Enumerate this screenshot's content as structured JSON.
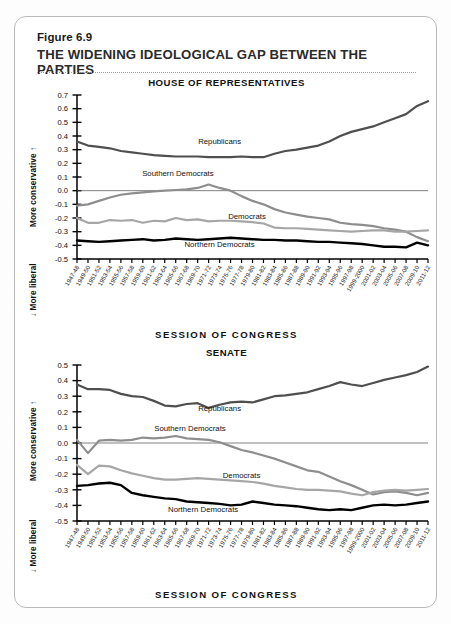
{
  "figure": {
    "number_label": "Figure 6.9",
    "title": "THE WIDENING IDEOLOGICAL GAP BETWEEN THE PARTIES"
  },
  "axis_titles": {
    "y_top": "More conservative",
    "y_bottom": "More liberal",
    "y_top_arrow": "↑",
    "y_bottom_arrow": "↓",
    "x": "SESSION OF CONGRESS"
  },
  "colors": {
    "republicans": "#4f4f4f",
    "southern_democrats": "#8e8e8e",
    "democrats": "#a6a6a6",
    "northern_democrats": "#000000",
    "axis": "#000000",
    "card_border": "#b9b9b9",
    "background": "#ffffff"
  },
  "chart_data": [
    {
      "type": "line",
      "title": "HOUSE OF REPRESENTATIVES",
      "xlabel": "SESSION OF CONGRESS",
      "ylabel": "More conservative / More liberal",
      "ylim": [
        -0.5,
        0.7
      ],
      "yticks": [
        0.7,
        0.6,
        0.5,
        0.4,
        0.3,
        0.2,
        0.1,
        0.0,
        -0.1,
        -0.2,
        -0.3,
        -0.4,
        -0.5
      ],
      "ytick_labels": [
        "0.7",
        "0.6",
        "0.5",
        "0.4",
        "0.3",
        "0.2",
        "0.1",
        "0.0",
        "-0.1",
        "-0.2",
        "-0.3",
        "-0.4",
        "-0.5"
      ],
      "grid": false,
      "zero_line": true,
      "legend_position": "inline-annotations",
      "categories": [
        "1947-48",
        "1949-50",
        "1951-52",
        "1953-54",
        "1955-56",
        "1957-58",
        "1959-60",
        "1961-62",
        "1963-64",
        "1965-66",
        "1967-68",
        "1969-70",
        "1971-72",
        "1973-74",
        "1975-76",
        "1977-78",
        "1979-80",
        "1981-82",
        "1983-84",
        "1985-86",
        "1987-88",
        "1989-90",
        "1991-92",
        "1993-94",
        "1995-96",
        "1997-98",
        "1999-2000",
        "2001-02",
        "2003-04",
        "2005-06",
        "2007-08",
        "2009-10",
        "2011-12"
      ],
      "series": [
        {
          "name": "Republicans",
          "color": "#4f4f4f",
          "values": [
            0.36,
            0.33,
            0.32,
            0.31,
            0.29,
            0.28,
            0.27,
            0.26,
            0.255,
            0.25,
            0.25,
            0.25,
            0.245,
            0.245,
            0.245,
            0.25,
            0.245,
            0.245,
            0.27,
            0.29,
            0.3,
            0.315,
            0.33,
            0.36,
            0.4,
            0.43,
            0.45,
            0.47,
            0.5,
            0.53,
            0.56,
            0.62,
            0.655
          ]
        },
        {
          "name": "Southern Democrats",
          "color": "#8e8e8e",
          "values": [
            -0.11,
            -0.1,
            -0.075,
            -0.05,
            -0.03,
            -0.02,
            -0.012,
            -0.005,
            0.0,
            0.005,
            0.01,
            0.02,
            0.045,
            0.02,
            0.0,
            -0.04,
            -0.075,
            -0.1,
            -0.135,
            -0.16,
            -0.175,
            -0.19,
            -0.2,
            -0.21,
            -0.235,
            -0.245,
            -0.25,
            -0.26,
            -0.275,
            -0.285,
            -0.3,
            -0.34,
            -0.37
          ]
        },
        {
          "name": "Democrats",
          "color": "#a6a6a6",
          "values": [
            -0.2,
            -0.235,
            -0.235,
            -0.215,
            -0.22,
            -0.215,
            -0.235,
            -0.22,
            -0.225,
            -0.2,
            -0.215,
            -0.21,
            -0.225,
            -0.22,
            -0.22,
            -0.225,
            -0.23,
            -0.24,
            -0.27,
            -0.275,
            -0.275,
            -0.28,
            -0.285,
            -0.29,
            -0.295,
            -0.3,
            -0.295,
            -0.29,
            -0.29,
            -0.3,
            -0.3,
            -0.295,
            -0.29
          ]
        },
        {
          "name": "Northern Democrats",
          "color": "#000000",
          "values": [
            -0.365,
            -0.37,
            -0.375,
            -0.37,
            -0.365,
            -0.36,
            -0.355,
            -0.365,
            -0.36,
            -0.35,
            -0.355,
            -0.36,
            -0.355,
            -0.35,
            -0.345,
            -0.35,
            -0.355,
            -0.36,
            -0.36,
            -0.365,
            -0.365,
            -0.37,
            -0.375,
            -0.375,
            -0.38,
            -0.385,
            -0.39,
            -0.4,
            -0.41,
            -0.41,
            -0.415,
            -0.38,
            -0.4
          ]
        }
      ]
    },
    {
      "type": "line",
      "title": "SENATE",
      "xlabel": "SESSION OF CONGRESS",
      "ylabel": "More conservative / More liberal",
      "ylim": [
        -0.5,
        0.5
      ],
      "yticks": [
        0.5,
        0.4,
        0.3,
        0.2,
        0.1,
        0.0,
        -0.1,
        -0.2,
        -0.3,
        -0.4,
        -0.5
      ],
      "ytick_labels": [
        "0.5",
        "0.4",
        "0.3",
        "0.2",
        "0.1",
        "0.0",
        "-0.1",
        "-0.2",
        "-0.3",
        "-0.4",
        "-0.5"
      ],
      "grid": false,
      "zero_line": true,
      "legend_position": "inline-annotations",
      "categories": [
        "1947-48",
        "1949-50",
        "1951-52",
        "1953-54",
        "1955-56",
        "1957-58",
        "1959-60",
        "1961-62",
        "1963-64",
        "1965-66",
        "1967-68",
        "1969-70",
        "1971-72",
        "1973-74",
        "1975-76",
        "1977-78",
        "1979-80",
        "1981-82",
        "1983-84",
        "1985-86",
        "1987-88",
        "1989-90",
        "1991-92",
        "1993-94",
        "1995-96",
        "1997-98",
        "1999-2000",
        "2001-02",
        "2003-04",
        "2005-06",
        "2007-08",
        "2009-10",
        "2011-12"
      ],
      "series": [
        {
          "name": "Republicans",
          "color": "#4f4f4f",
          "values": [
            0.375,
            0.345,
            0.345,
            0.34,
            0.315,
            0.3,
            0.295,
            0.27,
            0.24,
            0.235,
            0.25,
            0.255,
            0.225,
            0.245,
            0.26,
            0.265,
            0.26,
            0.28,
            0.3,
            0.305,
            0.315,
            0.325,
            0.345,
            0.365,
            0.39,
            0.375,
            0.365,
            0.385,
            0.405,
            0.42,
            0.435,
            0.455,
            0.49
          ]
        },
        {
          "name": "Southern Democrats",
          "color": "#8e8e8e",
          "values": [
            0.02,
            -0.065,
            0.015,
            0.02,
            0.015,
            0.02,
            0.035,
            0.03,
            0.035,
            0.045,
            0.03,
            0.025,
            0.02,
            0.005,
            -0.02,
            -0.045,
            -0.06,
            -0.08,
            -0.1,
            -0.125,
            -0.15,
            -0.175,
            -0.185,
            -0.215,
            -0.245,
            -0.27,
            -0.3,
            -0.33,
            -0.315,
            -0.31,
            -0.32,
            -0.335,
            -0.32
          ]
        },
        {
          "name": "Democrats",
          "color": "#a6a6a6",
          "values": [
            -0.14,
            -0.2,
            -0.145,
            -0.15,
            -0.175,
            -0.195,
            -0.21,
            -0.225,
            -0.235,
            -0.235,
            -0.23,
            -0.225,
            -0.23,
            -0.235,
            -0.24,
            -0.245,
            -0.25,
            -0.26,
            -0.275,
            -0.285,
            -0.295,
            -0.3,
            -0.3,
            -0.305,
            -0.31,
            -0.325,
            -0.335,
            -0.315,
            -0.305,
            -0.3,
            -0.305,
            -0.3,
            -0.295
          ]
        },
        {
          "name": "Northern Democrats",
          "color": "#000000",
          "values": [
            -0.275,
            -0.27,
            -0.26,
            -0.255,
            -0.27,
            -0.32,
            -0.335,
            -0.345,
            -0.355,
            -0.36,
            -0.375,
            -0.38,
            -0.385,
            -0.39,
            -0.4,
            -0.395,
            -0.375,
            -0.385,
            -0.395,
            -0.4,
            -0.405,
            -0.415,
            -0.425,
            -0.43,
            -0.425,
            -0.43,
            -0.415,
            -0.4,
            -0.395,
            -0.4,
            -0.395,
            -0.385,
            -0.375
          ]
        }
      ]
    }
  ]
}
